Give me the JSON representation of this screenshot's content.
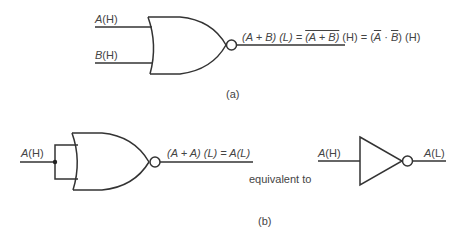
{
  "part_a": {
    "caption": "(a)",
    "gate_type": "NOR",
    "inputs": [
      {
        "var": "A",
        "level": "(H)"
      },
      {
        "var": "B",
        "level": "(H)"
      }
    ],
    "output_expression": {
      "part1": "(A + B) (L) = ",
      "part2_overbar": "(A + B)",
      "part3": " (H) = (",
      "a_bar": "A",
      "dot": " · ",
      "b_bar": "B",
      "part4": ") (H)"
    }
  },
  "part_b": {
    "caption": "(b)",
    "gate_type": "NOR",
    "input": {
      "var": "A",
      "level": "(H)"
    },
    "output_expression": "(A + A) (L) = A(L)",
    "equivalence_text": "equivalent to",
    "inverter": {
      "input": {
        "var": "A",
        "level": "(H)"
      },
      "output": {
        "var": "A",
        "level": "(L)"
      }
    }
  },
  "colors": {
    "line": "#333333",
    "text": "#444444",
    "background": "#ffffff"
  }
}
